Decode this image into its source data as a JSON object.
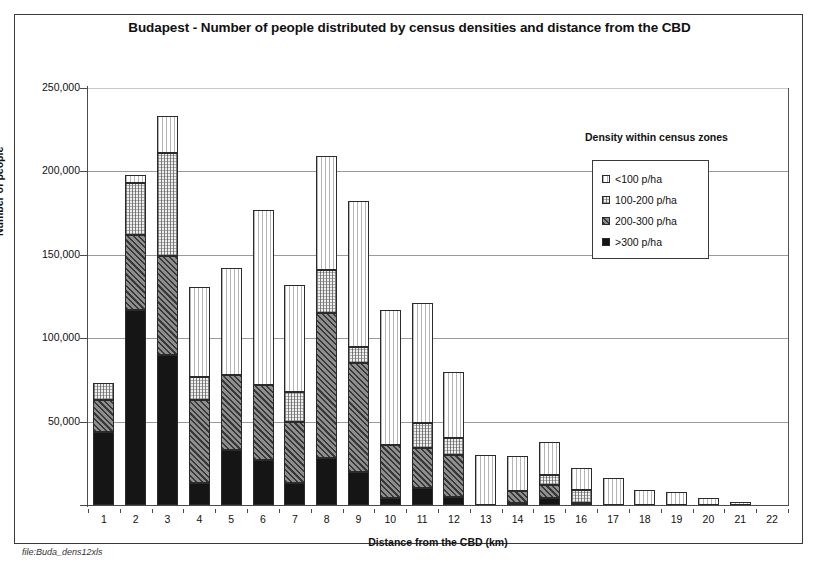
{
  "chart_data": {
    "type": "bar",
    "subtype": "stacked-bar",
    "title": "Budapest - Number of people distributed by census densities and distance from the CBD",
    "xlabel": "Distance from the CBD (km)",
    "ylabel": "Number of people",
    "ylim": [
      0,
      250000
    ],
    "yticks": [
      0,
      50000,
      100000,
      150000,
      200000,
      250000
    ],
    "ytick_labels": [
      "0",
      "50,000",
      "100,000",
      "150,000",
      "200,000",
      "250,000"
    ],
    "grid": true,
    "legend_position": "upper-right-inside",
    "legend_title": "Density within census zones",
    "categories": [
      "1",
      "2",
      "3",
      "4",
      "5",
      "6",
      "7",
      "8",
      "9",
      "10",
      "11",
      "12",
      "13",
      "14",
      "15",
      "16",
      "17",
      "18",
      "19",
      "20",
      "21",
      "22"
    ],
    "series": [
      {
        "name": ">300 p/ha",
        "pattern": "solid-black",
        "values": [
          44000,
          117000,
          90000,
          13000,
          33000,
          27000,
          13000,
          28000,
          20000,
          4000,
          10000,
          5000,
          0,
          1500,
          4000,
          1000,
          0,
          0,
          0,
          0,
          0,
          0
        ]
      },
      {
        "name": "200-300 p/ha",
        "pattern": "diagonal-hatch",
        "values": [
          19000,
          45000,
          59000,
          50000,
          45000,
          45000,
          37000,
          87000,
          65000,
          32000,
          24000,
          25000,
          0,
          7000,
          8000,
          0,
          0,
          0,
          0,
          0,
          0,
          0
        ]
      },
      {
        "name": "100-200 p/ha",
        "pattern": "cross-dotted",
        "values": [
          10000,
          31000,
          62000,
          14000,
          0,
          0,
          18000,
          26000,
          10000,
          0,
          15000,
          10000,
          0,
          0,
          6000,
          8000,
          0,
          0,
          0,
          0,
          0,
          0
        ]
      },
      {
        "name": "<100 p/ha",
        "pattern": "light-vertical",
        "values": [
          0,
          5000,
          22000,
          54000,
          64000,
          105000,
          64000,
          68000,
          87000,
          81000,
          72000,
          40000,
          30000,
          21000,
          20000,
          13000,
          16000,
          9000,
          8000,
          4000,
          2000,
          0
        ]
      }
    ],
    "totals": [
      73000,
      198000,
      233000,
      131000,
      142000,
      177000,
      132000,
      209000,
      182000,
      117000,
      121000,
      80000,
      30000,
      29500,
      38000,
      22000,
      16000,
      9000,
      8000,
      4000,
      2000,
      0
    ],
    "legend_entries": [
      {
        "label": "<100 p/ha",
        "pattern": "light-vertical"
      },
      {
        "label": "100-200 p/ha",
        "pattern": "cross-dotted"
      },
      {
        "label": "200-300 p/ha",
        "pattern": "diagonal-hatch"
      },
      {
        "label": ">300 p/ha",
        "pattern": "solid-black"
      }
    ],
    "colors": {
      "lt100": "#ffffff",
      "d100_200": "#efefef",
      "d200_300": "#8e8e8e",
      "gt300": "#151515",
      "axis": "#4a4a4a",
      "grid": "#9a9a9a",
      "text": "#111111"
    }
  },
  "footer": {
    "file_note": "file:Buda_dens12xls",
    "file_note_secondary": ""
  }
}
